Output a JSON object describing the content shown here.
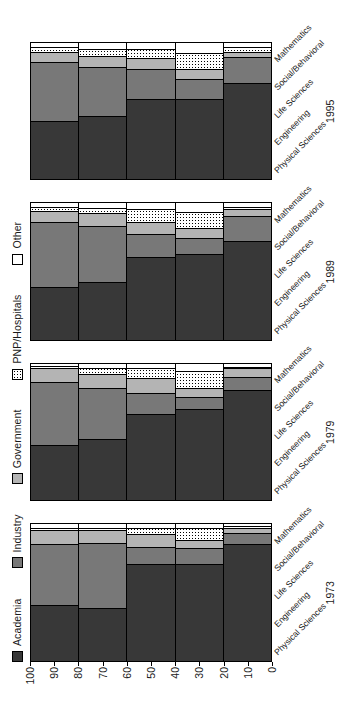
{
  "chart_data": {
    "type": "bar",
    "orientation": "stacked-horizontal-rotated",
    "title": "",
    "xlabel": "",
    "ylabel": "Percent",
    "ylim": [
      0,
      100
    ],
    "yticks": [
      0,
      10,
      20,
      30,
      40,
      50,
      60,
      70,
      80,
      90,
      100
    ],
    "grid": false,
    "legend_position": "top",
    "groups": [
      "1973",
      "1979",
      "1989",
      "1995"
    ],
    "categories": [
      "Physical Sciences",
      "Engineering",
      "Life Sciences",
      "Social/Behavioral",
      "Mathematics"
    ],
    "series": [
      {
        "name": "Academia",
        "color": "#383838",
        "pattern": "solid"
      },
      {
        "name": "Industry",
        "color": "#787878",
        "pattern": "solid"
      },
      {
        "name": "Government",
        "color": "#b4b4b4",
        "pattern": "solid"
      },
      {
        "name": "PNP/Hospitals",
        "color": "#ffffff",
        "pattern": "dotted"
      },
      {
        "name": "Other",
        "color": "#ffffff",
        "pattern": "none"
      }
    ],
    "values": {
      "1973": {
        "Physical Sciences": [
          40,
          45,
          10,
          2,
          3
        ],
        "Engineering": [
          38,
          48,
          9,
          2,
          3
        ],
        "Life Sciences": [
          70,
          13,
          9,
          5,
          3
        ],
        "Social/Behavioral": [
          70,
          12,
          6,
          9,
          3
        ],
        "Mathematics": [
          85,
          8,
          4,
          1,
          2
        ]
      },
      "1979": {
        "Physical Sciences": [
          40,
          46,
          10,
          2,
          2
        ],
        "Engineering": [
          44,
          38,
          10,
          4,
          4
        ],
        "Life Sciences": [
          63,
          15,
          11,
          7,
          4
        ],
        "Social/Behavioral": [
          66,
          9,
          7,
          12,
          6
        ],
        "Mathematics": [
          80,
          10,
          6,
          1,
          3
        ]
      },
      "1989": {
        "Physical Sciences": [
          38,
          48,
          8,
          3,
          3
        ],
        "Engineering": [
          42,
          41,
          9,
          4,
          4
        ],
        "Life Sciences": [
          60,
          17,
          9,
          9,
          5
        ],
        "Social/Behavioral": [
          62,
          12,
          7,
          12,
          7
        ],
        "Mathematics": [
          72,
          18,
          5,
          2,
          3
        ]
      },
      "1995": {
        "Physical Sciences": [
          42,
          43,
          8,
          3,
          4
        ],
        "Engineering": [
          46,
          36,
          8,
          5,
          5
        ],
        "Life Sciences": [
          58,
          22,
          8,
          7,
          5
        ],
        "Social/Behavioral": [
          58,
          15,
          7,
          12,
          8
        ],
        "Mathematics": [
          70,
          19,
          4,
          3,
          4
        ]
      }
    }
  },
  "legend": {
    "items": [
      {
        "label": "Academia"
      },
      {
        "label": "Industry"
      },
      {
        "label": "Government"
      },
      {
        "label": "PNP/Hospitals"
      },
      {
        "label": "Other"
      }
    ]
  }
}
